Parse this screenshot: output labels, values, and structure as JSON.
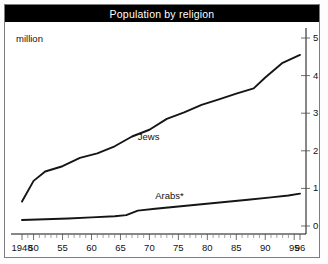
{
  "title": "Population by religion",
  "unit_label": "million",
  "chart_data": {
    "type": "line",
    "title": "Population by religion",
    "subtitle": "",
    "xlabel": "",
    "ylabel": "million",
    "ylim": [
      0,
      5
    ],
    "xlim": [
      1948,
      1996
    ],
    "grid": false,
    "legend_position": "inline-annotation",
    "y_ticks": [
      "0",
      "1",
      "2",
      "3",
      "4",
      "5"
    ],
    "y_tick_values": [
      0,
      1,
      2,
      3,
      4,
      5
    ],
    "y_axis_side": "right",
    "x_ticks": [
      "1948",
      "50",
      "55",
      "60",
      "65",
      "70",
      "75",
      "80",
      "85",
      "90",
      "95",
      "96"
    ],
    "x_tick_values": [
      1948,
      1950,
      1955,
      1960,
      1965,
      1970,
      1975,
      1980,
      1985,
      1990,
      1995,
      1996
    ],
    "x_minor_tick_interval": 1,
    "annotations": [
      {
        "text": "Jews",
        "x": 1968,
        "y": 2.35
      },
      {
        "text": "Arabs*",
        "x": 1971,
        "y": 0.78
      }
    ],
    "series": [
      {
        "name": "Jews",
        "color": "#151515",
        "x": [
          1948,
          1950,
          1952,
          1955,
          1958,
          1961,
          1964,
          1967,
          1970,
          1973,
          1976,
          1979,
          1982,
          1985,
          1988,
          1990,
          1993,
          1996
        ],
        "values": [
          0.65,
          1.2,
          1.45,
          1.59,
          1.81,
          1.93,
          2.12,
          2.38,
          2.56,
          2.85,
          3.02,
          3.22,
          3.37,
          3.52,
          3.66,
          3.95,
          4.34,
          4.55
        ]
      },
      {
        "name": "Arabs*",
        "color": "#151515",
        "x": [
          1948,
          1952,
          1956,
          1960,
          1964,
          1966,
          1968,
          1971,
          1975,
          1979,
          1983,
          1987,
          1991,
          1994,
          1996
        ],
        "values": [
          0.16,
          0.18,
          0.2,
          0.23,
          0.26,
          0.29,
          0.41,
          0.46,
          0.52,
          0.58,
          0.64,
          0.7,
          0.76,
          0.81,
          0.86
        ]
      }
    ],
    "footnote_marker": "*"
  }
}
